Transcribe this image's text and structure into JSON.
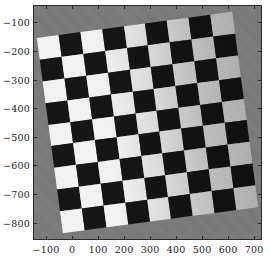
{
  "figure": {
    "background_color": "#ffffff",
    "plot_background_color": "#7a7a7a",
    "axis_color": "#2b2b2b",
    "tick_label_color": "#1a1a1a"
  },
  "chart_data": {
    "type": "heatmap",
    "title": "",
    "subtitle": "",
    "xlabel": "",
    "ylabel": "",
    "xlim": [
      -150,
      730
    ],
    "ylim": [
      -860,
      -40
    ],
    "grid": false,
    "legend": null,
    "annotations": [],
    "x_ticks": [
      -100,
      0,
      100,
      200,
      300,
      400,
      500,
      600,
      700
    ],
    "x_tick_labels": [
      "-100",
      "0",
      "100",
      "200",
      "300",
      "400",
      "500",
      "600",
      "700"
    ],
    "y_ticks": [
      -800,
      -700,
      -600,
      -500,
      -400,
      -300,
      -200,
      -100
    ],
    "y_tick_labels": [
      "-800",
      "-700",
      "-600",
      "-500",
      "-400",
      "-500",
      "-200",
      "-100"
    ],
    "y_axis_inverted": true,
    "target": {
      "pattern": "checkerboard",
      "rows": 9,
      "columns": 9,
      "rotation_degrees": -7.6,
      "dark_square_color": "#151515",
      "light_square_color": "#f2f2f2",
      "plate_color": "#7a7a7a",
      "illumination": "left-to-right falloff; light squares read near white on the left edge and mid-gray on the right edge",
      "corners_xy": [
        [
          -95,
          -760
        ],
        [
          645,
          -840
        ],
        [
          700,
          -105
        ],
        [
          -45,
          -35
        ]
      ]
    },
    "cells": [
      [
        "light",
        "dark",
        "light",
        "dark",
        "light",
        "dark",
        "light",
        "dark",
        "light"
      ],
      [
        "dark",
        "light",
        "dark",
        "light",
        "dark",
        "light",
        "dark",
        "light",
        "dark"
      ],
      [
        "light",
        "dark",
        "light",
        "dark",
        "light",
        "dark",
        "light",
        "dark",
        "light"
      ],
      [
        "dark",
        "light",
        "dark",
        "light",
        "dark",
        "light",
        "dark",
        "light",
        "dark"
      ],
      [
        "light",
        "dark",
        "light",
        "dark",
        "light",
        "dark",
        "light",
        "dark",
        "light"
      ],
      [
        "dark",
        "light",
        "dark",
        "light",
        "dark",
        "light",
        "dark",
        "light",
        "dark"
      ],
      [
        "light",
        "dark",
        "light",
        "dark",
        "light",
        "dark",
        "light",
        "dark",
        "light"
      ],
      [
        "dark",
        "light",
        "dark",
        "light",
        "dark",
        "light",
        "dark",
        "light",
        "dark"
      ],
      [
        "light",
        "dark",
        "light",
        "dark",
        "light",
        "dark",
        "light",
        "dark",
        "light"
      ]
    ]
  }
}
